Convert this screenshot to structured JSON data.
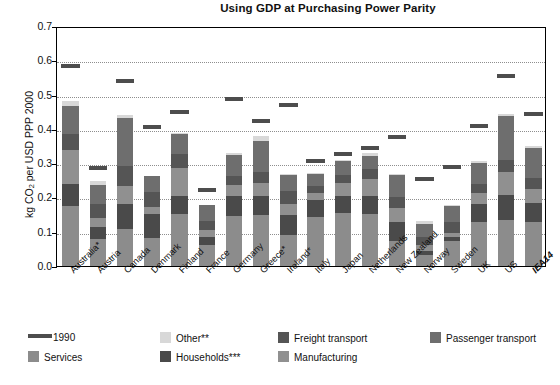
{
  "chart_data": {
    "type": "bar",
    "title": "Using GDP at Purchasing Power Parity",
    "xlabel": "",
    "ylabel": "kg CO2 per USD PPP 2000",
    "ylabel_html": "kg CO<sub>2</sub> per USD PPP 2000",
    "ylim": [
      0.0,
      0.7
    ],
    "yticks": [
      "0.0",
      "0.1",
      "0.2",
      "0.3",
      "0.4",
      "0.5",
      "0.6",
      "0.7"
    ],
    "ytick_values": [
      0.0,
      0.1,
      0.2,
      0.3,
      0.4,
      0.5,
      0.6,
      0.7
    ],
    "grid": true,
    "stacked": true,
    "legend_position": "bottom",
    "categories": [
      "Australia*",
      "Austria",
      "Canada",
      "Denmark",
      "Finland",
      "France",
      "Germany",
      "Greece*",
      "Ireland*",
      "Italy",
      "Japan",
      "Netherlands",
      "New Zealand",
      "Norway",
      "Sweden",
      "UK",
      "US",
      "IEA14"
    ],
    "series": [
      {
        "name": "Services",
        "color": "#8c8c8c",
        "values": [
          0.175,
          0.078,
          0.108,
          0.083,
          0.153,
          0.062,
          0.145,
          0.148,
          0.09,
          0.142,
          0.155,
          0.152,
          0.074,
          0.032,
          0.072,
          0.128,
          0.135,
          0.129
        ]
      },
      {
        "name": "Households***",
        "color": "#4a4a4a",
        "values": [
          0.065,
          0.035,
          0.072,
          0.068,
          0.052,
          0.022,
          0.058,
          0.055,
          0.06,
          0.052,
          0.048,
          0.052,
          0.054,
          0.011,
          0.012,
          0.052,
          0.073,
          0.055
        ]
      },
      {
        "name": "Manufacturing",
        "color": "#909090",
        "values": [
          0.098,
          0.028,
          0.052,
          0.022,
          0.082,
          0.02,
          0.032,
          0.038,
          0.032,
          0.02,
          0.04,
          0.05,
          0.04,
          0.019,
          0.013,
          0.032,
          0.065,
          0.042
        ]
      },
      {
        "name": "Freight transport",
        "color": "#555555",
        "values": [
          0.048,
          0.039,
          0.06,
          0.042,
          0.04,
          0.028,
          0.028,
          0.033,
          0.036,
          0.02,
          0.023,
          0.028,
          0.033,
          0.022,
          0.03,
          0.026,
          0.036,
          0.031
        ]
      },
      {
        "name": "Passenger transport",
        "color": "#6e6e6e",
        "values": [
          0.082,
          0.055,
          0.14,
          0.048,
          0.057,
          0.045,
          0.06,
          0.092,
          0.047,
          0.035,
          0.04,
          0.038,
          0.065,
          0.039,
          0.05,
          0.062,
          0.128,
          0.088
        ]
      },
      {
        "name": "Other**",
        "color": "#d8d8d8",
        "values": [
          0.012,
          0.013,
          0.008,
          0.0,
          0.005,
          0.0,
          0.006,
          0.014,
          0.003,
          0.001,
          0.003,
          0.01,
          0.003,
          0.008,
          0.002,
          0.005,
          0.007,
          0.006
        ]
      }
    ],
    "reference_series": {
      "name": "1990",
      "color": "#4d4d4d",
      "values": [
        0.582,
        0.285,
        0.54,
        0.405,
        0.45,
        0.222,
        0.487,
        0.422,
        0.47,
        0.305,
        0.328,
        0.345,
        0.375,
        0.255,
        0.29,
        0.408,
        0.553,
        0.442
      ]
    },
    "totals": [
      0.48,
      0.248,
      0.44,
      0.263,
      0.389,
      0.177,
      0.329,
      0.38,
      0.268,
      0.27,
      0.309,
      0.33,
      0.269,
      0.131,
      0.179,
      0.305,
      0.444,
      0.351
    ]
  },
  "legend": {
    "row1": [
      {
        "key": "1990",
        "label": "1990",
        "swatch": "line",
        "color": "#4d4d4d"
      },
      {
        "key": "other",
        "label": "Other**",
        "swatch": "box",
        "color": "#d8d8d8"
      },
      {
        "key": "freight",
        "label": "Freight transport",
        "swatch": "box",
        "color": "#555555"
      },
      {
        "key": "passenger",
        "label": "Passenger transport",
        "swatch": "box",
        "color": "#6e6e6e"
      }
    ],
    "row2": [
      {
        "key": "services",
        "label": "Services",
        "swatch": "box",
        "color": "#8c8c8c"
      },
      {
        "key": "households",
        "label": "Households***",
        "swatch": "box",
        "color": "#4a4a4a"
      },
      {
        "key": "manufacturing",
        "label": "Manufacturing",
        "swatch": "box",
        "color": "#909090"
      }
    ]
  }
}
